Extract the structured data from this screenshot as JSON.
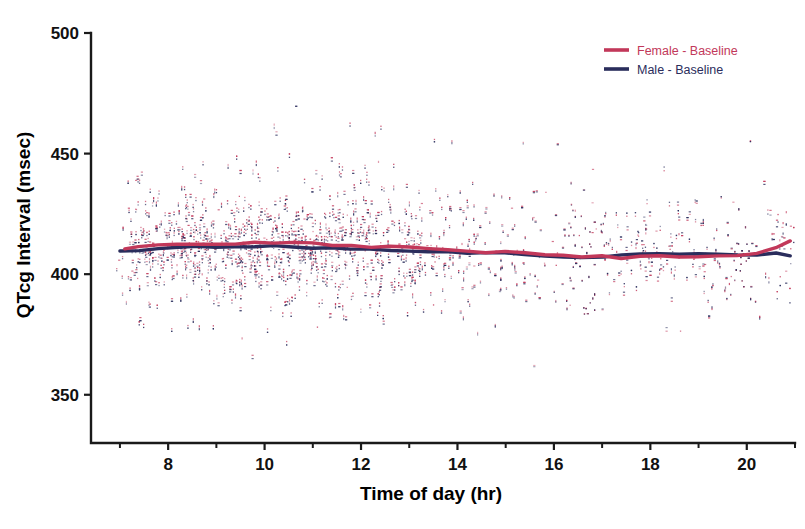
{
  "chart_data": {
    "type": "scatter",
    "title": "",
    "xlabel": "Time of day (hr)",
    "ylabel": "QTcg Interval (msec)",
    "xlim": [
      6.4,
      21.0
    ],
    "ylim": [
      330,
      500
    ],
    "xticks": [
      8,
      10,
      12,
      14,
      16,
      18,
      20
    ],
    "xtick_labels": [
      "8",
      "10",
      "12",
      "14",
      "16",
      "18",
      "20"
    ],
    "xticks_minor": [
      7,
      9,
      11,
      13,
      15,
      17,
      19,
      21
    ],
    "yticks": [
      350,
      400,
      450,
      500
    ],
    "ytick_labels": [
      "350",
      "400",
      "450",
      "500"
    ],
    "grid": false,
    "legend_position": "top-right",
    "series": [
      {
        "name": "Female - Baseline",
        "color": "#c2385a",
        "marker": "point",
        "trend_x": [
          7.1,
          7.4,
          7.8,
          8.2,
          8.6,
          9.0,
          9.4,
          9.8,
          10.2,
          10.6,
          11.0,
          11.4,
          11.8,
          12.2,
          12.6,
          13.0,
          13.4,
          13.8,
          14.2,
          14.6,
          15.0,
          15.4,
          15.8,
          16.2,
          16.6,
          17.0,
          17.4,
          17.8,
          18.2,
          18.6,
          19.0,
          19.4,
          19.8,
          20.2,
          20.6,
          20.9
        ],
        "trend_y": [
          410.5,
          411.5,
          412.0,
          412.2,
          412.6,
          412.8,
          413.0,
          413.2,
          413.0,
          412.8,
          412.6,
          412.4,
          412.0,
          411.6,
          411.2,
          410.8,
          410.4,
          410.0,
          409.8,
          409.4,
          409.0,
          408.6,
          408.2,
          407.8,
          407.4,
          407.2,
          407.0,
          407.0,
          407.2,
          407.4,
          407.3,
          407.2,
          407.4,
          408.6,
          411.5,
          413.8
        ]
      },
      {
        "name": "Male - Baseline",
        "color": "#2a2d5c",
        "marker": "point",
        "trend_x": [
          7.0,
          7.4,
          7.8,
          8.2,
          8.6,
          9.0,
          9.4,
          9.8,
          10.2,
          10.6,
          11.0,
          11.4,
          11.8,
          12.2,
          12.6,
          13.0,
          13.4,
          13.8,
          14.2,
          14.6,
          15.0,
          15.4,
          15.8,
          16.2,
          16.6,
          17.0,
          17.4,
          17.8,
          18.2,
          18.6,
          19.0,
          19.4,
          19.8,
          20.2,
          20.6,
          20.9
        ],
        "trend_y": [
          409.6,
          410.2,
          410.8,
          411.2,
          411.4,
          411.6,
          411.8,
          411.8,
          411.6,
          411.4,
          411.2,
          411.0,
          410.8,
          410.4,
          410.0,
          409.6,
          409.4,
          409.2,
          409.0,
          408.8,
          408.4,
          408.0,
          407.8,
          407.4,
          407.2,
          407.6,
          408.2,
          408.6,
          408.8,
          408.6,
          408.2,
          407.8,
          407.6,
          408.2,
          408.8,
          407.6
        ]
      }
    ],
    "scatter_description": {
      "point_count_approx": 3200,
      "x_range_dense": [
        7.0,
        12.5
      ],
      "y_spread_msec": 35,
      "y_outlier_max": 460,
      "y_outlier_min": 375
    }
  },
  "legend": {
    "entries": [
      {
        "label": "Female - Baseline",
        "color": "#c2385a"
      },
      {
        "label": "Male    - Baseline",
        "color": "#2a2d5c"
      }
    ]
  }
}
